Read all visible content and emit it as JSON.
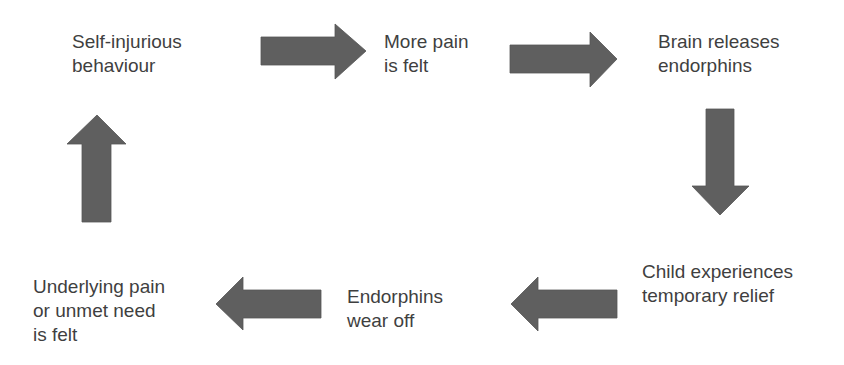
{
  "diagram": {
    "type": "cycle",
    "arrow_color": "#5f5f5f",
    "text_color": "#3f3f3f",
    "nodes": [
      {
        "id": "self-injurious-behaviour",
        "text": "Self-injurious\nbehaviour"
      },
      {
        "id": "more-pain-felt",
        "text": "More pain\nis felt"
      },
      {
        "id": "brain-releases-endorphins",
        "text": "Brain releases\nendorphins"
      },
      {
        "id": "child-experiences-relief",
        "text": "Child experiences\ntemporary relief"
      },
      {
        "id": "endorphins-wear-off",
        "text": "Endorphins\nwear off"
      },
      {
        "id": "underlying-pain-felt",
        "text": "Underlying pain\nor unmet need\nis felt"
      }
    ],
    "edges": [
      {
        "from": "self-injurious-behaviour",
        "to": "more-pain-felt",
        "direction": "right"
      },
      {
        "from": "more-pain-felt",
        "to": "brain-releases-endorphins",
        "direction": "right"
      },
      {
        "from": "brain-releases-endorphins",
        "to": "child-experiences-relief",
        "direction": "down"
      },
      {
        "from": "child-experiences-relief",
        "to": "endorphins-wear-off",
        "direction": "left"
      },
      {
        "from": "endorphins-wear-off",
        "to": "underlying-pain-felt",
        "direction": "left"
      },
      {
        "from": "underlying-pain-felt",
        "to": "self-injurious-behaviour",
        "direction": "up"
      }
    ]
  }
}
